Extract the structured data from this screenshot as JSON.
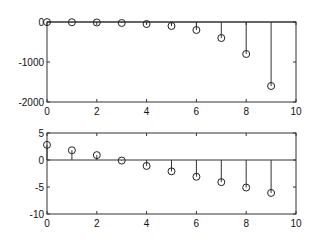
{
  "chart_data": [
    {
      "type": "stem",
      "title": "",
      "xlabel": "",
      "ylabel": "",
      "xlim": [
        0,
        10
      ],
      "ylim": [
        -2000,
        0
      ],
      "xticks": [
        0,
        2,
        4,
        6,
        8,
        10
      ],
      "yticks": [
        0,
        -1000,
        -2000
      ],
      "xtick_labels": [
        "0",
        "2",
        "4",
        "6",
        "8",
        "10"
      ],
      "ytick_labels": [
        "0",
        "-1000",
        "-2000"
      ],
      "grid": false,
      "marker": "circle",
      "baseline": 0,
      "x": [
        0,
        1,
        2,
        3,
        4,
        5,
        6,
        7,
        8,
        9
      ],
      "values": [
        -3,
        -6,
        -12.5,
        -25,
        -50,
        -100,
        -200,
        -400,
        -800,
        -1600
      ]
    },
    {
      "type": "stem",
      "title": "",
      "xlabel": "",
      "ylabel": "",
      "xlim": [
        0,
        10
      ],
      "ylim": [
        -10,
        5
      ],
      "xticks": [
        0,
        2,
        4,
        6,
        8,
        10
      ],
      "yticks": [
        5,
        0,
        -5,
        -10
      ],
      "xtick_labels": [
        "0",
        "2",
        "4",
        "6",
        "8",
        "10"
      ],
      "ytick_labels": [
        "5",
        "0",
        "-5",
        "-10"
      ],
      "grid": false,
      "marker": "circle",
      "baseline": 0,
      "x": [
        0,
        1,
        2,
        3,
        4,
        5,
        6,
        7,
        8,
        9
      ],
      "values": [
        2.8,
        1.8,
        0.9,
        -0.1,
        -1.1,
        -2.1,
        -3.1,
        -4.1,
        -5.1,
        -6.1
      ]
    }
  ]
}
